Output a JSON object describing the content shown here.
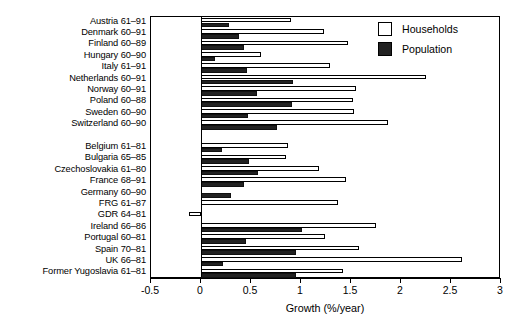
{
  "chart_data": {
    "type": "bar",
    "orientation": "horizontal",
    "title": "",
    "xlabel": "Growth (%/year)",
    "ylabel": "",
    "xlim": [
      -0.5,
      3
    ],
    "xticks": [
      -0.5,
      0,
      0.5,
      1,
      1.5,
      2,
      2.5,
      3
    ],
    "xticklabels": [
      "-0.5",
      "0",
      "0.5",
      "1",
      "1.5",
      "2",
      "2.5",
      "3"
    ],
    "grid": false,
    "legend": {
      "position": "top-right",
      "entries": [
        {
          "label": "Households",
          "color": "#ffffff"
        },
        {
          "label": "Population",
          "color": "#222222"
        }
      ]
    },
    "series": [
      {
        "name": "Households",
        "color": "#ffffff"
      },
      {
        "name": "Population",
        "color": "#222222"
      }
    ],
    "groups": [
      {
        "name": "group-1",
        "categories": [
          "Austria 61–91",
          "Denmark 60–91",
          "Finland 60–89",
          "Hungary 60–90",
          "Italy 61–91",
          "Netherlands 60–91",
          "Norway 60–91",
          "Poland 60–88",
          "Sweden 60–90",
          "Switzerland 60–90"
        ],
        "households": [
          0.9,
          1.23,
          1.47,
          0.6,
          1.29,
          2.25,
          1.55,
          1.52,
          1.53,
          1.87
        ],
        "population": [
          0.28,
          0.38,
          0.43,
          0.14,
          0.46,
          0.92,
          0.56,
          0.91,
          0.47,
          0.76
        ]
      },
      {
        "name": "group-2",
        "categories": [
          "Belgium 61–81",
          "Bulgaria 65–85",
          "Czechoslovakia 61–80",
          "France 68–91",
          "Germany 60–90",
          "FRG 61–87",
          "GDR 64–81",
          "Ireland 66–86",
          "Portugal 60–81",
          "Spain 70–81",
          "UK 66–81",
          "Former Yugoslavia 61–81"
        ],
        "households": [
          0.87,
          0.85,
          1.18,
          1.45,
          0.0,
          1.37,
          -0.12,
          1.75,
          1.24,
          1.58,
          2.61,
          1.42
        ],
        "population": [
          0.21,
          0.48,
          0.57,
          0.43,
          0.3,
          0.0,
          0.0,
          1.01,
          0.45,
          0.95,
          0.22,
          0.95
        ]
      }
    ]
  }
}
